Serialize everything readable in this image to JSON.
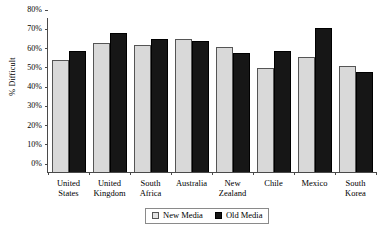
{
  "chart_data": {
    "type": "bar",
    "title": "",
    "xlabel": "",
    "ylabel": "% Difficult",
    "ylim": [
      0,
      80
    ],
    "ytick_values": [
      80,
      70,
      60,
      50,
      40,
      30,
      20,
      10,
      0
    ],
    "ytick_labels": [
      "80%",
      "70%",
      "60%",
      "50%",
      "40%",
      "30%",
      "20%",
      "10%",
      "0%"
    ],
    "grid": false,
    "legend_position": "bottom-center",
    "categories": [
      "United States",
      "United Kingdom",
      "South Africa",
      "Australia",
      "New Zealand",
      "Chile",
      "Mexico",
      "South Korea"
    ],
    "category_lines": [
      [
        "United",
        "States"
      ],
      [
        "United",
        "Kingdom"
      ],
      [
        "South",
        "Africa"
      ],
      [
        "Australia"
      ],
      [
        "New",
        "Zealand"
      ],
      [
        "Chile"
      ],
      [
        "Mexico"
      ],
      [
        "South",
        "Korea"
      ]
    ],
    "series": [
      {
        "name": "New Media",
        "color": "#d9d9d9",
        "values": [
          58,
          67,
          66,
          69,
          65,
          54,
          60,
          55
        ]
      },
      {
        "name": "Old Media",
        "color": "#161616",
        "values": [
          63,
          72,
          69,
          68,
          62,
          63,
          75,
          52
        ]
      }
    ]
  },
  "legend": {
    "entries": [
      {
        "label": "New Media"
      },
      {
        "label": "Old Media"
      }
    ]
  }
}
